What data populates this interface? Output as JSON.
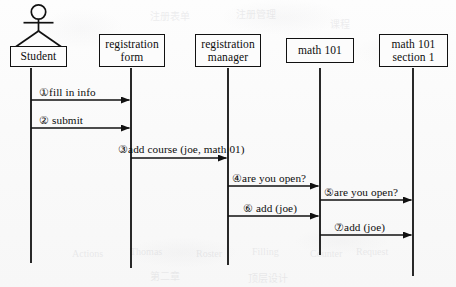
{
  "diagram": {
    "type": "uml-sequence-diagram",
    "title": "",
    "canvas": {
      "width": 456,
      "height": 287
    },
    "background_color": "#fbfbfb",
    "line_color": "#111111",
    "text_color": "#0d0d0d",
    "participants": [
      {
        "id": "student",
        "label_lines": [
          "Student"
        ],
        "kind": "actor",
        "has_stick_figure": true,
        "box": {
          "x": 10,
          "y": 46,
          "w": 57,
          "h": 21
        },
        "lifeline_x": 31,
        "lifeline_top": 68,
        "lifeline_bottom": 263
      },
      {
        "id": "registration-form",
        "label_lines": [
          "registration",
          "form"
        ],
        "kind": "object",
        "has_stick_figure": false,
        "box": {
          "x": 99,
          "y": 34,
          "w": 66,
          "h": 33
        },
        "lifeline_x": 131,
        "lifeline_top": 68,
        "lifeline_bottom": 268
      },
      {
        "id": "registration-manager",
        "label_lines": [
          "registration",
          "manager"
        ],
        "kind": "object",
        "has_stick_figure": false,
        "box": {
          "x": 195,
          "y": 34,
          "w": 66,
          "h": 33
        },
        "lifeline_x": 228,
        "lifeline_top": 68,
        "lifeline_bottom": 265
      },
      {
        "id": "math-101",
        "label_lines": [
          "math 101"
        ],
        "kind": "object",
        "has_stick_figure": false,
        "box": {
          "x": 286,
          "y": 38,
          "w": 68,
          "h": 25
        },
        "lifeline_x": 320,
        "lifeline_top": 68,
        "lifeline_bottom": 255
      },
      {
        "id": "math-101-section-1",
        "label_lines": [
          "math 101",
          "section  1"
        ],
        "kind": "object",
        "has_stick_figure": false,
        "box": {
          "x": 379,
          "y": 34,
          "w": 69,
          "h": 33
        },
        "lifeline_x": 413,
        "lifeline_top": 68,
        "lifeline_bottom": 276
      }
    ],
    "messages": [
      {
        "seq": "①",
        "text": "fill in info",
        "full_label": "①fill in info",
        "from": "student",
        "to": "registration-form",
        "from_x": 31,
        "to_x": 131,
        "y": 100,
        "label_x": 39,
        "label_y": 86,
        "direction": "right"
      },
      {
        "seq": "②",
        "text": "submit",
        "full_label": "② submit",
        "from": "student",
        "to": "registration-form",
        "from_x": 31,
        "to_x": 131,
        "y": 128,
        "label_x": 39,
        "label_y": 114,
        "direction": "right"
      },
      {
        "seq": "③",
        "text": "add course (joe, math 01)",
        "full_label": "③add course (joe, math 01)",
        "from": "registration-form",
        "to": "registration-manager",
        "from_x": 131,
        "to_x": 228,
        "y": 158,
        "label_x": 118,
        "label_y": 143,
        "direction": "right"
      },
      {
        "seq": "④",
        "text": "are you open?",
        "full_label": "④are you open?",
        "from": "registration-manager",
        "to": "math-101",
        "from_x": 228,
        "to_x": 320,
        "y": 186,
        "label_x": 232,
        "label_y": 172,
        "direction": "right"
      },
      {
        "seq": "⑤",
        "text": "are you open?",
        "full_label": "⑤are you open?",
        "from": "math-101",
        "to": "math-101-section-1",
        "from_x": 320,
        "to_x": 413,
        "y": 200,
        "label_x": 324,
        "label_y": 186,
        "direction": "right"
      },
      {
        "seq": "⑥",
        "text": "add (joe)",
        "full_label": "⑥ add  (joe)",
        "from": "registration-manager",
        "to": "math-101",
        "from_x": 228,
        "to_x": 320,
        "y": 216,
        "label_x": 243,
        "label_y": 202,
        "direction": "right"
      },
      {
        "seq": "⑦",
        "text": "add (joe)",
        "full_label": "⑦add  (joe)",
        "from": "math-101",
        "to": "math-101-section-1",
        "from_x": 320,
        "to_x": 413,
        "y": 235,
        "label_x": 334,
        "label_y": 221,
        "direction": "right"
      }
    ],
    "bleed_through_marks": [
      {
        "x": 150,
        "y": 8,
        "text": "注册表单"
      },
      {
        "x": 236,
        "y": 6,
        "text": "注册管理"
      },
      {
        "x": 330,
        "y": 16,
        "text": "课程"
      },
      {
        "x": 72,
        "y": 248,
        "text": "Actions"
      },
      {
        "x": 130,
        "y": 246,
        "text": "Thomas"
      },
      {
        "x": 196,
        "y": 248,
        "text": "Roster"
      },
      {
        "x": 252,
        "y": 246,
        "text": "Filling"
      },
      {
        "x": 310,
        "y": 248,
        "text": "Counter"
      },
      {
        "x": 356,
        "y": 246,
        "text": "Request"
      },
      {
        "x": 150,
        "y": 268,
        "text": "第二章"
      },
      {
        "x": 248,
        "y": 270,
        "text": "顶层设计"
      }
    ]
  }
}
